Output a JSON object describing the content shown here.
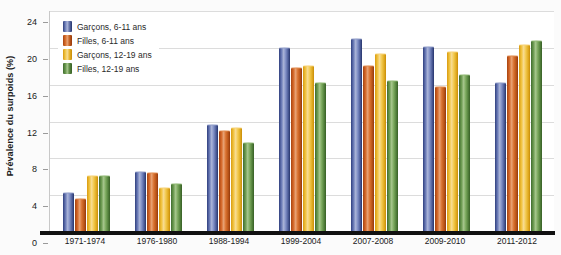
{
  "chart_data": {
    "type": "bar",
    "title": "",
    "subtitle": "",
    "xlabel": "",
    "ylabel": "Prévalence du surpoids (%)",
    "ylim": [
      0,
      24
    ],
    "yticks": [
      0,
      4,
      8,
      12,
      16,
      20,
      24
    ],
    "ytick_labels": [
      "0",
      "4",
      "8",
      "12",
      "16",
      "20",
      "24"
    ],
    "grid": true,
    "legend_position": "top-left",
    "categories": [
      "1971-1974",
      "1976-1980",
      "1988-1994",
      "1999-2004",
      "2007-2008",
      "2009-2010",
      "2011-2012"
    ],
    "series": [
      {
        "name": "Garçons, 6-11 ans",
        "color": "#4a5a96",
        "values": [
          4.2,
          6.5,
          11.6,
          20.0,
          21.0,
          20.1,
          16.2
        ]
      },
      {
        "name": "Filles, 6-11 ans",
        "color": "#c45a1c",
        "values": [
          3.6,
          6.4,
          11.0,
          17.8,
          18.0,
          15.7,
          19.1
        ]
      },
      {
        "name": "Garçons, 12-19 ans",
        "color": "#e9b92c",
        "values": [
          6.1,
          4.8,
          11.3,
          18.0,
          19.3,
          19.6,
          20.3
        ]
      },
      {
        "name": "Filles, 12-19 ans",
        "color": "#5d8b43",
        "values": [
          6.1,
          5.2,
          9.7,
          16.2,
          16.4,
          17.1,
          20.7
        ]
      }
    ]
  }
}
